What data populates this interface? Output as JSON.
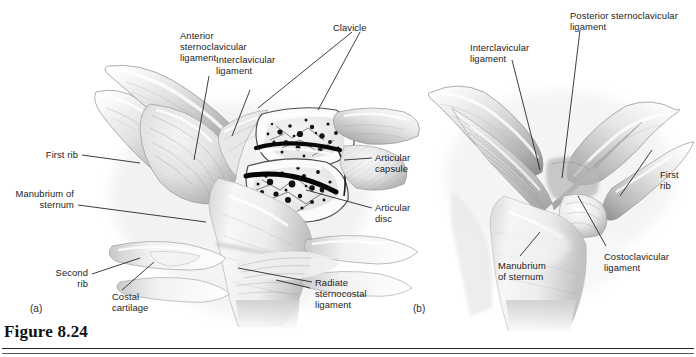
{
  "figure": {
    "caption": "Figure 8.24",
    "panel_a_mark": "(a)",
    "panel_b_mark": "(b)",
    "background_color": "#ffffff",
    "ink_color": "#1b1b1b"
  },
  "labels": {
    "anterior_sternoclavicular_ligament": "Anterior\nsternoclavicular\nligament",
    "interclavicular_ligament_a": "Interclavicular\nligament",
    "clavicle": "Clavicle",
    "interclavicular_ligament_b": "Interclavicular\nligament",
    "posterior_sternoclavicular_ligament": "Posterior sternoclavicular\nligament",
    "first_rib_a": "First rib",
    "manubrium_of_sternum_a": "Manubrium of\nsternum",
    "second_rib": "Second\nrib",
    "costal_cartilage": "Costal\ncartilage",
    "radiate_sternocostal_ligament": "Radiate\nsternocostal\nligament",
    "articular_capsule": "Articular\ncapsule",
    "articular_disc": "Articular\ndisc",
    "first_rib_b": "First\nrib",
    "costoclavicular_ligament": "Costoclavicular\nligament",
    "manubrium_of_sternum_b": "Manubrium\nof sternum"
  },
  "illustration": {
    "panel_a_view": "anterior view of sternoclavicular joints with right joint cut away",
    "panel_b_view": "posterior view of sternoclavicular joints",
    "tones": {
      "bone_light": "#f4f4f4",
      "bone_mid": "#d8d8d8",
      "shade": "#a8a8a8",
      "deep_shade": "#7c7c7c",
      "marrow": "#151515",
      "disc": "#0a0a0a"
    }
  }
}
